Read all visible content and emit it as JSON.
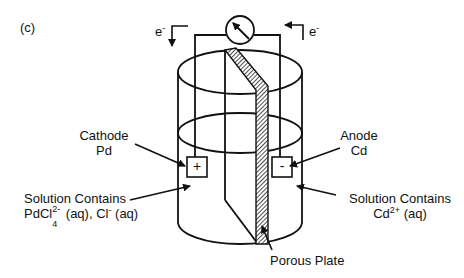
{
  "panel_label": "(c)",
  "electron_left": {
    "symbol": "e",
    "charge": "-"
  },
  "electron_right": {
    "symbol": "e",
    "charge": "-"
  },
  "cathode": {
    "title": "Cathode",
    "metal": "Pd",
    "sign": "+"
  },
  "anode": {
    "title": "Anode",
    "metal": "Cd",
    "sign": "-"
  },
  "left_solution": {
    "line1": "Solution Contains",
    "species1_base": "PdCl",
    "species1_sup": "2-",
    "species1_sub": "4",
    "species1_state": " (aq), ",
    "species2_base": "Cl",
    "species2_sup": "-",
    "species2_state": " (aq)"
  },
  "right_solution": {
    "line1": "Solution Contains",
    "species_base": "Cd",
    "species_sup": "2+",
    "species_state": " (aq)"
  },
  "porous_plate_label": "Porous Plate",
  "colors": {
    "line": "#111111",
    "background": "#ffffff"
  }
}
